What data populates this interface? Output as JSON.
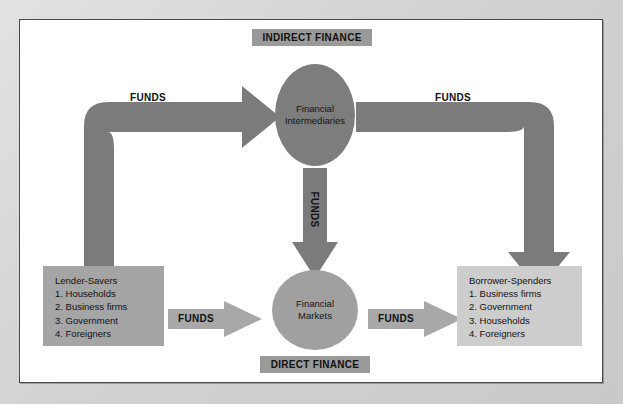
{
  "diagram": {
    "labels": {
      "indirect_finance": "INDIRECT FINANCE",
      "direct_finance": "DIRECT FINANCE"
    },
    "nodes": {
      "financial_intermediaries": {
        "line1": "Financial",
        "line2": "Intermediaries"
      },
      "financial_markets": {
        "line1": "Financial",
        "line2": "Markets"
      },
      "lender_savers": {
        "title": "Lender-Savers",
        "items": [
          "1. Households",
          "2. Business firms",
          "3. Government",
          "4. Foreigners"
        ]
      },
      "borrower_spenders": {
        "title": "Borrower-Spenders",
        "items": [
          "1. Business firms",
          "2. Government",
          "3. Households",
          "4. Foreigners"
        ]
      }
    },
    "flows": [
      {
        "id": "lenders-to-intermediaries",
        "label": "FUNDS",
        "orientation": "horizontal"
      },
      {
        "id": "intermediaries-to-borrowers",
        "label": "FUNDS",
        "orientation": "horizontal"
      },
      {
        "id": "intermediaries-to-markets",
        "label": "FUNDS",
        "orientation": "vertical"
      },
      {
        "id": "lenders-to-markets",
        "label": "FUNDS",
        "orientation": "horizontal"
      },
      {
        "id": "markets-to-borrowers",
        "label": "FUNDS",
        "orientation": "horizontal"
      }
    ],
    "colors": {
      "mat": "#d9d9d9",
      "canvas": "#ffffff",
      "border": "#4a4a4a",
      "chip": "#9a9a9a",
      "pipe_dark": "#7b7b7b",
      "arrow_light": "#a8a8a8",
      "ellipse_dark": "#7d7d7d",
      "ellipse_mid": "#a0a0a0",
      "box_lenders": "#a5a5a5",
      "box_borrowers": "#cdcdcd",
      "text": "#111111"
    }
  }
}
